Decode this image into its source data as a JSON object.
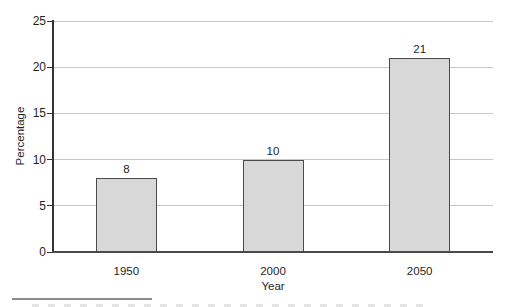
{
  "chart_data": {
    "type": "bar",
    "categories": [
      "1950",
      "2000",
      "2050"
    ],
    "values": [
      8,
      10,
      21
    ],
    "bar_labels": [
      "8",
      "10",
      "21"
    ],
    "title": "",
    "xlabel": "Year",
    "ylabel": "Percentage",
    "ylim": [
      0,
      25
    ],
    "yticks": [
      0,
      5,
      10,
      15,
      20,
      25
    ],
    "grid": "horizontal",
    "legend": "none",
    "colors": {
      "bar_fill": "#d8d8d8",
      "bar_border": "#4a4a4a",
      "gridline": "#c6c6c6",
      "axis": "#333333",
      "text": "#1f1f1f",
      "footnote_rule": "#8c8c8c"
    }
  }
}
